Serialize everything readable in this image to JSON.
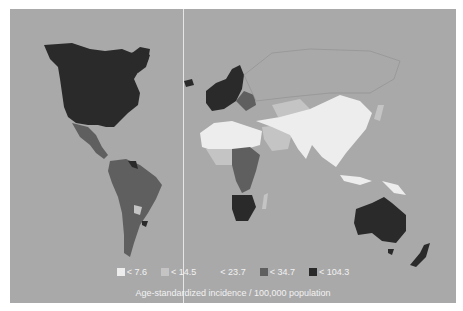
{
  "map": {
    "title": "",
    "metric": "Age-standardized incidence / 100,000 population",
    "background_color": "#a9a9a9",
    "legend": {
      "title": "Age-standardized incidence / 100,000 population",
      "items": [
        {
          "label": "< 7.6",
          "color": "#ededed"
        },
        {
          "label": "< 14.5",
          "color": "#c4c4c4"
        },
        {
          "label": "< 23.7",
          "color": "#a9a9a9"
        },
        {
          "label": "< 34.7",
          "color": "#5f5f5f"
        },
        {
          "label": "< 104.3",
          "color": "#2a2a2a"
        }
      ]
    },
    "regions": [
      {
        "name": "North America (USA, Canada, Greenland)",
        "class": "< 104.3"
      },
      {
        "name": "Mexico & Central America",
        "class": "< 34.7"
      },
      {
        "name": "South America (most)",
        "class": "< 34.7"
      },
      {
        "name": "Paraguay",
        "class": "< 14.5"
      },
      {
        "name": "Uruguay",
        "class": "< 104.3"
      },
      {
        "name": "Venezuela",
        "class": "< 104.3"
      },
      {
        "name": "Northern & Western Europe",
        "class": "< 104.3"
      },
      {
        "name": "Eastern Europe",
        "class": "< 34.7"
      },
      {
        "name": "North Africa",
        "class": "< 7.6"
      },
      {
        "name": "Central/East Africa",
        "class": "< 34.7"
      },
      {
        "name": "Southern Africa",
        "class": "< 104.3"
      },
      {
        "name": "Middle East",
        "class": "< 14.5"
      },
      {
        "name": "Central Asia",
        "class": "< 14.5"
      },
      {
        "name": "China, India, Southeast Asia",
        "class": "< 7.6"
      },
      {
        "name": "Russia",
        "class": "< 23.7"
      },
      {
        "name": "Australia",
        "class": "< 104.3"
      },
      {
        "name": "New Zealand",
        "class": "< 104.3"
      }
    ]
  }
}
